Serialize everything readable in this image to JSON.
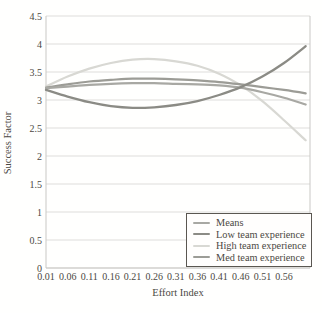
{
  "chart_data": {
    "type": "line",
    "title": "",
    "xlabel": "Effort Index",
    "ylabel": "Success Factor",
    "xlim": [
      0.01,
      0.62
    ],
    "ylim": [
      0,
      4.5
    ],
    "grid": "horizontal",
    "legend_position": "bottom-right",
    "xticks": {
      "values": [
        0.01,
        0.06,
        0.11,
        0.16,
        0.21,
        0.26,
        0.31,
        0.36,
        0.41,
        0.46,
        0.51,
        0.56
      ],
      "labels": [
        "0.01",
        "0.06",
        "0.11",
        "0.16",
        "0.21",
        "0.26",
        "0.31",
        "0.36",
        "0.41",
        "0.46",
        "0.51",
        "0.56"
      ]
    },
    "yticks": {
      "values": [
        0,
        0.5,
        1,
        1.5,
        2,
        2.5,
        3,
        3.5,
        4,
        4.5
      ],
      "labels": [
        "0",
        "0.5",
        "1",
        "1.5",
        "2",
        "2.5",
        "3",
        "3.5",
        "4",
        "4.5"
      ]
    },
    "x": [
      0.01,
      0.06,
      0.11,
      0.16,
      0.21,
      0.26,
      0.31,
      0.36,
      0.41,
      0.46,
      0.51,
      0.56,
      0.61
    ],
    "series": [
      {
        "name": "Means",
        "color": "#a8a8a3",
        "width": 2.2,
        "values": [
          3.21,
          3.24,
          3.27,
          3.29,
          3.3,
          3.3,
          3.29,
          3.28,
          3.26,
          3.22,
          3.14,
          3.04,
          2.92
        ]
      },
      {
        "name": "Low team experience",
        "color": "#8b8b85",
        "width": 2.3,
        "values": [
          3.18,
          3.06,
          2.96,
          2.89,
          2.86,
          2.87,
          2.91,
          2.98,
          3.09,
          3.23,
          3.42,
          3.66,
          3.96
        ]
      },
      {
        "name": "High team experience",
        "color": "#d8d8d3",
        "width": 2.2,
        "values": [
          3.24,
          3.42,
          3.56,
          3.66,
          3.72,
          3.73,
          3.69,
          3.61,
          3.47,
          3.26,
          2.98,
          2.64,
          2.28
        ]
      },
      {
        "name": "Med team experience",
        "color": "#9c9c96",
        "width": 2.2,
        "values": [
          3.22,
          3.28,
          3.33,
          3.36,
          3.38,
          3.38,
          3.37,
          3.35,
          3.32,
          3.28,
          3.23,
          3.18,
          3.12
        ]
      }
    ],
    "colors": {
      "grid": "#dedddb",
      "axis": "#c9c8c5",
      "text": "#4b4843",
      "legend_border": "#5a5751",
      "background": "#fffffe"
    }
  }
}
